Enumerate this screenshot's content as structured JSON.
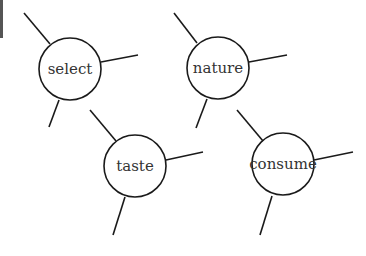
{
  "diagram": {
    "type": "concept-web",
    "nodes": [
      {
        "label": "select",
        "cx": 70,
        "cy": 69,
        "r": 31,
        "spokes": [
          [
            24,
            13,
            50,
            44
          ],
          [
            101,
            62,
            138,
            55
          ],
          [
            59,
            100,
            49,
            127
          ]
        ]
      },
      {
        "label": "nature",
        "cx": 218,
        "cy": 68,
        "r": 31,
        "spokes": [
          [
            174,
            13,
            197,
            43
          ],
          [
            249,
            62,
            287,
            55
          ],
          [
            207,
            99,
            196,
            128
          ]
        ]
      },
      {
        "label": "taste",
        "cx": 135,
        "cy": 166,
        "r": 31,
        "spokes": [
          [
            90,
            110,
            116,
            141
          ],
          [
            166,
            160,
            203,
            152
          ],
          [
            125,
            197,
            113,
            235
          ]
        ]
      },
      {
        "label": "consume",
        "cx": 283,
        "cy": 164,
        "r": 31,
        "spokes": [
          [
            237,
            110,
            263,
            141
          ],
          [
            314,
            160,
            353,
            152
          ],
          [
            272,
            196,
            260,
            235
          ]
        ]
      }
    ],
    "stroke_color": "#1a1a1a"
  }
}
